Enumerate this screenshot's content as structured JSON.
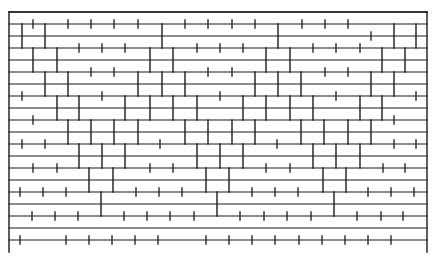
{
  "diagram": {
    "type": "brick-course-pattern",
    "stroke_color": "#1a1a1a",
    "background": "#ffffff",
    "frame": {
      "left_x": 9,
      "right_x": 427,
      "top_y": 12,
      "bottom_y": 252
    },
    "horizontal_lines_y": [
      12,
      24,
      36,
      48,
      60,
      72,
      84,
      96,
      108,
      120,
      132,
      144,
      156,
      168,
      180,
      192,
      204,
      216,
      228,
      240
    ],
    "courses": [
      {
        "name": "A",
        "y_top": 24,
        "y_bottom": 48,
        "walls_x": [
          22,
          45,
          162,
          278,
          394,
          416
        ]
      },
      {
        "name": "B",
        "y_top": 48,
        "y_bottom": 72,
        "walls_x": [
          33,
          57,
          150,
          173,
          266,
          290,
          382,
          405
        ]
      },
      {
        "name": "C",
        "y_top": 72,
        "y_bottom": 96,
        "walls_x": [
          45,
          68,
          138,
          162,
          185,
          255,
          278,
          301,
          371,
          394
        ]
      },
      {
        "name": "D",
        "y_top": 96,
        "y_bottom": 120,
        "walls_x": [
          57,
          79,
          125,
          150,
          173,
          197,
          243,
          266,
          290,
          313,
          360,
          382
        ]
      },
      {
        "name": "E",
        "y_top": 120,
        "y_bottom": 144,
        "walls_x": [
          68,
          91,
          114,
          138,
          185,
          208,
          232,
          255,
          301,
          324,
          348,
          371
        ]
      },
      {
        "name": "F",
        "y_top": 144,
        "y_bottom": 168,
        "walls_x": [
          79,
          102,
          125,
          197,
          220,
          243,
          313,
          336,
          360
        ]
      },
      {
        "name": "G",
        "y_top": 168,
        "y_bottom": 192,
        "walls_x": [
          89,
          113,
          206,
          229,
          323,
          346
        ]
      },
      {
        "name": "H",
        "y_top": 192,
        "y_bottom": 216,
        "walls_x": [
          101,
          217,
          334
        ]
      }
    ],
    "ticks": [
      {
        "y": 24,
        "x": [
          33,
          68,
          91,
          114,
          138,
          185,
          208,
          232,
          255,
          302,
          325,
          348
        ]
      },
      {
        "y": 36,
        "x": [
          371
        ]
      },
      {
        "y": 48,
        "x": [
          79,
          102,
          125,
          197,
          220,
          243,
          313,
          336,
          360
        ]
      },
      {
        "y": 72,
        "x": [
          91,
          114,
          208,
          232,
          325,
          348
        ]
      },
      {
        "y": 96,
        "x": [
          22,
          102,
          220,
          336,
          416
        ]
      },
      {
        "y": 120,
        "x": [
          33,
          394
        ]
      },
      {
        "y": 144,
        "x": [
          22,
          45,
          160,
          277,
          394,
          416
        ]
      },
      {
        "y": 168,
        "x": [
          33,
          57,
          150,
          173,
          266,
          290,
          383,
          405
        ]
      },
      {
        "y": 192,
        "x": [
          20,
          43,
          66,
          136,
          159,
          182,
          252,
          275,
          298,
          368,
          391,
          414
        ]
      },
      {
        "y": 216,
        "x": [
          32,
          55,
          78,
          124,
          147,
          170,
          194,
          240,
          264,
          287,
          311,
          357,
          381,
          403
        ]
      },
      {
        "y": 240,
        "x": [
          20,
          66,
          89,
          112,
          135,
          158,
          206,
          229,
          252,
          275,
          299,
          322,
          345,
          368,
          391
        ]
      }
    ],
    "tick_half_length": 4
  }
}
